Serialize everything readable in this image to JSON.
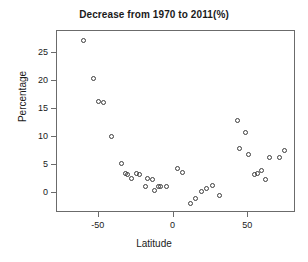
{
  "chart_data": {
    "type": "scatter",
    "title": "Decrease from 1970 to 2011(%)",
    "xlabel": "Latitude",
    "ylabel": "Percentage",
    "xlim": [
      -78,
      82
    ],
    "ylim": [
      -3.5,
      29
    ],
    "grid": false,
    "legend": null,
    "xticks": [
      -50,
      0,
      50
    ],
    "xticklabels": [
      "-50",
      "0",
      "50"
    ],
    "yticks": [
      0,
      5,
      10,
      15,
      20,
      25
    ],
    "yticklabels": [
      "0",
      "5",
      "10",
      "15",
      "20",
      "25"
    ],
    "marker": "open-circle",
    "marker_color": "#3d3d3d",
    "x": [
      -60.5,
      -53.5,
      -50.0,
      -47.0,
      -41.5,
      -35.0,
      -32.0,
      -30.5,
      -28.0,
      -24.5,
      -23.0,
      -19.0,
      -17.5,
      -14.0,
      -12.5,
      -10.0,
      -8.5,
      -5.0,
      2.5,
      6.0,
      11.5,
      14.5,
      18.5,
      22.0,
      26.0,
      31.0,
      42.5,
      44.0,
      48.5,
      50.5,
      54.5,
      56.5,
      59.0,
      61.5,
      64.0,
      71.0,
      74.5
    ],
    "y": [
      27.3,
      20.6,
      16.5,
      16.2,
      10.1,
      5.3,
      3.5,
      3.3,
      2.6,
      3.5,
      3.3,
      1.2,
      2.7,
      2.5,
      0.6,
      1.3,
      1.3,
      1.3,
      4.4,
      3.8,
      -1.8,
      -0.9,
      0.3,
      0.9,
      1.5,
      -0.3,
      13.0,
      8.1,
      10.8,
      6.9,
      3.4,
      3.6,
      4.1,
      2.5,
      6.5,
      6.4,
      7.7
    ],
    "points": [
      {
        "x": -60.5,
        "y": 27.3
      },
      {
        "x": -53.5,
        "y": 20.6
      },
      {
        "x": -50.0,
        "y": 16.5
      },
      {
        "x": -47.0,
        "y": 16.2
      },
      {
        "x": -41.5,
        "y": 10.1
      },
      {
        "x": -35.0,
        "y": 5.3
      },
      {
        "x": -32.0,
        "y": 3.5
      },
      {
        "x": -30.5,
        "y": 3.3
      },
      {
        "x": -28.0,
        "y": 2.6
      },
      {
        "x": -24.5,
        "y": 3.5
      },
      {
        "x": -23.0,
        "y": 3.3
      },
      {
        "x": -19.0,
        "y": 1.2
      },
      {
        "x": -17.5,
        "y": 2.7
      },
      {
        "x": -14.0,
        "y": 2.5
      },
      {
        "x": -12.5,
        "y": 0.6
      },
      {
        "x": -10.0,
        "y": 1.3
      },
      {
        "x": -8.5,
        "y": 1.3
      },
      {
        "x": -5.0,
        "y": 1.3
      },
      {
        "x": 2.5,
        "y": 4.4
      },
      {
        "x": 6.0,
        "y": 3.8
      },
      {
        "x": 11.5,
        "y": -1.8
      },
      {
        "x": 14.5,
        "y": -0.9
      },
      {
        "x": 18.5,
        "y": 0.3
      },
      {
        "x": 22.0,
        "y": 0.9
      },
      {
        "x": 26.0,
        "y": 1.5
      },
      {
        "x": 31.0,
        "y": -0.3
      },
      {
        "x": 42.5,
        "y": 13.0
      },
      {
        "x": 44.0,
        "y": 8.1
      },
      {
        "x": 48.5,
        "y": 10.8
      },
      {
        "x": 50.5,
        "y": 6.9
      },
      {
        "x": 54.5,
        "y": 3.4
      },
      {
        "x": 56.5,
        "y": 3.6
      },
      {
        "x": 59.0,
        "y": 4.1
      },
      {
        "x": 61.5,
        "y": 2.5
      },
      {
        "x": 64.0,
        "y": 6.5
      },
      {
        "x": 71.0,
        "y": 6.4
      },
      {
        "x": 74.5,
        "y": 7.7
      }
    ]
  }
}
